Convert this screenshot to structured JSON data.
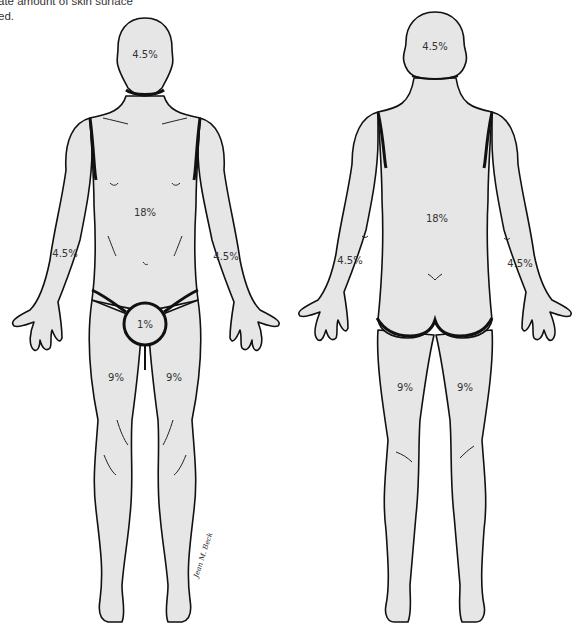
{
  "caption": {
    "line1": "ate amount of skin surface",
    "line2": "ed."
  },
  "colors": {
    "skin": "#e6e6e6",
    "outline": "#111111",
    "text": "#333333",
    "background": "#ffffff"
  },
  "front": {
    "head": "4.5%",
    "trunk": "18%",
    "right_arm": "4.5%",
    "left_arm": "4.5%",
    "genitalia": "1%",
    "right_leg": "9%",
    "left_leg": "9%"
  },
  "back": {
    "head": "4.5%",
    "trunk": "18%",
    "left_arm": "4.5%",
    "right_arm": "4.5%",
    "left_leg": "9%",
    "right_leg": "9%"
  },
  "signature": "Jean M. Beck"
}
